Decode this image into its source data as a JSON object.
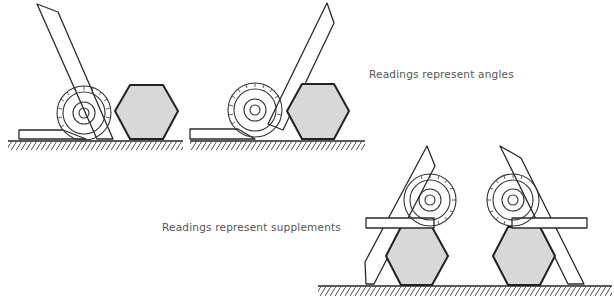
{
  "diagram": {
    "captions": {
      "top": "Readings represent angles",
      "bottom": "Readings represent supplements"
    },
    "figures": [
      {
        "id": "fig-1",
        "group": "angles",
        "description": "protractor blade leaning right against hexagon left face"
      },
      {
        "id": "fig-2",
        "group": "angles",
        "description": "protractor blade leaning right against hexagon left face, steeper blade"
      },
      {
        "id": "fig-3",
        "group": "supplements",
        "description": "protractor on top of hexagon, blade crossing left"
      },
      {
        "id": "fig-4",
        "group": "supplements",
        "description": "protractor on top of hexagon, blade crossing right"
      }
    ],
    "colors": {
      "line": "#2a2a2a",
      "hexagon_fill": "#d8d8d8",
      "caption_text": "#555555",
      "background": "#ffffff"
    }
  }
}
